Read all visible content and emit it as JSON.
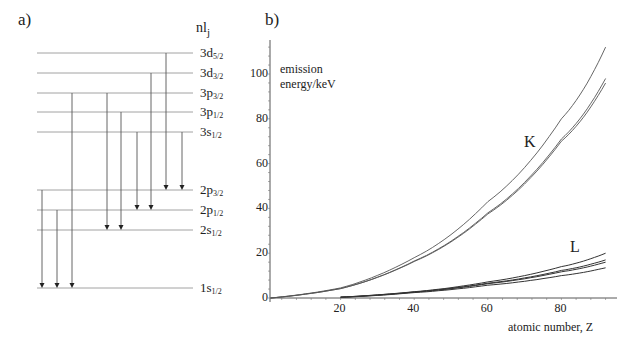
{
  "panel_a": {
    "label": "a)",
    "header": {
      "main": "nl",
      "sub": "j"
    },
    "line_x_start": 37,
    "line_x_end": 193,
    "levels": [
      {
        "id": "3d52",
        "name": "3d",
        "j": "5/2",
        "y": 53
      },
      {
        "id": "3d32",
        "name": "3d",
        "j": "3/2",
        "y": 73
      },
      {
        "id": "3p32",
        "name": "3p",
        "j": "3/2",
        "y": 93
      },
      {
        "id": "3p12",
        "name": "3p",
        "j": "1/2",
        "y": 112
      },
      {
        "id": "3s12",
        "name": "3s",
        "j": "1/2",
        "y": 132
      },
      {
        "id": "2p32",
        "name": "2p",
        "j": "3/2",
        "y": 190
      },
      {
        "id": "2p12",
        "name": "2p",
        "j": "1/2",
        "y": 210
      },
      {
        "id": "2s12",
        "name": "2s",
        "j": "1/2",
        "y": 230
      },
      {
        "id": "1s12",
        "name": "1s",
        "j": "1/2",
        "y": 288
      }
    ],
    "transitions": [
      {
        "x": 42,
        "from": "2p32",
        "to": "1s12"
      },
      {
        "x": 57,
        "from": "2p12",
        "to": "1s12"
      },
      {
        "x": 72,
        "from": "3p32",
        "to": "1s12"
      },
      {
        "x": 107,
        "from": "3p32",
        "to": "2s12"
      },
      {
        "x": 121,
        "from": "3p12",
        "to": "2s12"
      },
      {
        "x": 137,
        "from": "3s12",
        "to": "2p12"
      },
      {
        "x": 151,
        "from": "3d32",
        "to": "2p12"
      },
      {
        "x": 166,
        "from": "3d52",
        "to": "2p32"
      },
      {
        "x": 182,
        "from": "3s12",
        "to": "2p32"
      }
    ]
  },
  "panel_b": {
    "label": "b)",
    "ylabel_line1": "emission",
    "ylabel_line2": "energy/keV",
    "xlabel": "atomic number, Z",
    "series_label_K": "K",
    "series_label_L": "L"
  },
  "chart_data": {
    "type": "line",
    "title": "",
    "xlabel": "atomic number, Z",
    "ylabel": "emission energy/keV",
    "xlim": [
      0,
      95
    ],
    "ylim": [
      0,
      115
    ],
    "xticks": [
      20,
      40,
      60,
      80
    ],
    "yticks": [
      0,
      20,
      40,
      60,
      80,
      100
    ],
    "grid": false,
    "legend": "inline labels: K (upper curves), L (lower curves)",
    "series": [
      {
        "name": "K (upper)",
        "group": "K",
        "x": [
          1,
          20,
          40,
          60,
          80,
          92
        ],
        "values": [
          0,
          4.5,
          18,
          43,
          80,
          112
        ]
      },
      {
        "name": "K (middle)",
        "group": "K",
        "x": [
          1,
          20,
          40,
          60,
          80,
          92
        ],
        "values": [
          0,
          4.2,
          16.5,
          38,
          71,
          98
        ]
      },
      {
        "name": "K (lower)",
        "group": "K",
        "x": [
          1,
          20,
          40,
          60,
          80,
          92
        ],
        "values": [
          0,
          4.2,
          16.3,
          37.5,
          70,
          96
        ]
      },
      {
        "name": "L (1)",
        "group": "L",
        "x": [
          20,
          40,
          60,
          80,
          92
        ],
        "values": [
          0.4,
          2.8,
          7.2,
          14,
          20
        ]
      },
      {
        "name": "L (2)",
        "group": "L",
        "x": [
          20,
          40,
          60,
          80,
          92
        ],
        "values": [
          0.4,
          2.7,
          6.6,
          12.3,
          17
        ]
      },
      {
        "name": "L (3)",
        "group": "L",
        "x": [
          20,
          40,
          60,
          80,
          92
        ],
        "values": [
          0.3,
          2.6,
          6.4,
          11.7,
          16
        ]
      },
      {
        "name": "L (4)",
        "group": "L",
        "x": [
          20,
          40,
          60,
          80,
          92
        ],
        "values": [
          0.3,
          2.4,
          5.7,
          10,
          13.5
        ]
      }
    ]
  }
}
